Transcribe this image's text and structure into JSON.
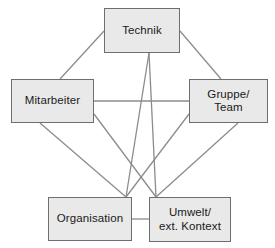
{
  "diagram": {
    "type": "pentagram-network",
    "edge_color": "#8c8c8c",
    "node_fill": "#e9e9e9",
    "node_border": "#6e6e6e",
    "background": "#ffffff",
    "nodes": [
      {
        "id": "technik",
        "label": "Technik",
        "x": 104,
        "y": 8,
        "w": 76,
        "h": 45
      },
      {
        "id": "mitarbeiter",
        "label": "Mitarbeiter",
        "x": 11,
        "y": 79,
        "w": 83,
        "h": 44
      },
      {
        "id": "gruppe",
        "label": "Gruppe/\nTeam",
        "x": 189,
        "y": 79,
        "w": 79,
        "h": 44
      },
      {
        "id": "organisation",
        "label": "Organisation",
        "x": 48,
        "y": 197,
        "w": 84,
        "h": 44
      },
      {
        "id": "umwelt",
        "label": "Umwelt/\next. Kontext",
        "x": 149,
        "y": 197,
        "w": 82,
        "h": 45
      }
    ],
    "edges": [
      {
        "id": "technik-mitarbeiter",
        "from": "technik",
        "to": "mitarbeiter",
        "x1": 104,
        "y1": 31,
        "x2": 60,
        "y2": 79
      },
      {
        "id": "technik-gruppe",
        "from": "technik",
        "to": "gruppe",
        "x1": 180,
        "y1": 31,
        "x2": 221,
        "y2": 79
      },
      {
        "id": "mitarbeiter-gruppe",
        "from": "mitarbeiter",
        "to": "gruppe",
        "x1": 94,
        "y1": 101,
        "x2": 189,
        "y2": 101
      },
      {
        "id": "mitarbeiter-organisation",
        "from": "mitarbeiter",
        "to": "organisation",
        "x1": 40,
        "y1": 123,
        "x2": 126,
        "y2": 197
      },
      {
        "id": "mitarbeiter-umwelt",
        "from": "mitarbeiter",
        "to": "umwelt",
        "x1": 94,
        "y1": 114,
        "x2": 156,
        "y2": 197
      },
      {
        "id": "gruppe-umwelt",
        "from": "gruppe",
        "to": "umwelt",
        "x1": 238,
        "y1": 123,
        "x2": 156,
        "y2": 197
      },
      {
        "id": "gruppe-organisation",
        "from": "gruppe",
        "to": "organisation",
        "x1": 189,
        "y1": 114,
        "x2": 126,
        "y2": 197
      },
      {
        "id": "technik-organisation",
        "from": "technik",
        "to": "organisation",
        "x1": 149,
        "y1": 53,
        "x2": 126,
        "y2": 197
      },
      {
        "id": "technik-umwelt",
        "from": "technik",
        "to": "umwelt",
        "x1": 149,
        "y1": 53,
        "x2": 156,
        "y2": 197
      },
      {
        "id": "organisation-umwelt",
        "from": "organisation",
        "to": "umwelt",
        "x1": 132,
        "y1": 219,
        "x2": 149,
        "y2": 219
      }
    ]
  }
}
